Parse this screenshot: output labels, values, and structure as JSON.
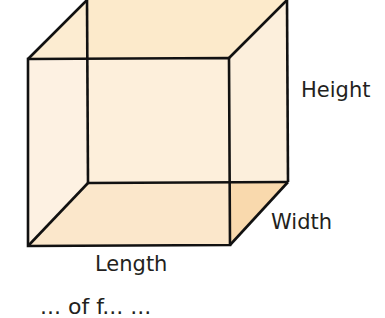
{
  "diagram": {
    "labels": {
      "height": "Height",
      "width": "Width",
      "length": "Length"
    },
    "caption_partial": "... of f... ...",
    "colors": {
      "edge": "#111111",
      "front_face": "#fdf2e4",
      "back_top_face": "#fce9c8",
      "side_face": "#fcefdc",
      "bottom_face": "#f9d9ad",
      "text": "#231f20"
    },
    "vertices": {
      "front_top_left": [
        28,
        59
      ],
      "front_top_right": [
        229,
        58
      ],
      "front_bottom_left": [
        28,
        246
      ],
      "front_bottom_right": [
        230,
        245
      ],
      "back_top_left": [
        87,
        0
      ],
      "back_top_right": [
        287,
        0
      ],
      "back_bottom_left": [
        88,
        183
      ],
      "back_bottom_right": [
        288,
        182
      ]
    }
  }
}
